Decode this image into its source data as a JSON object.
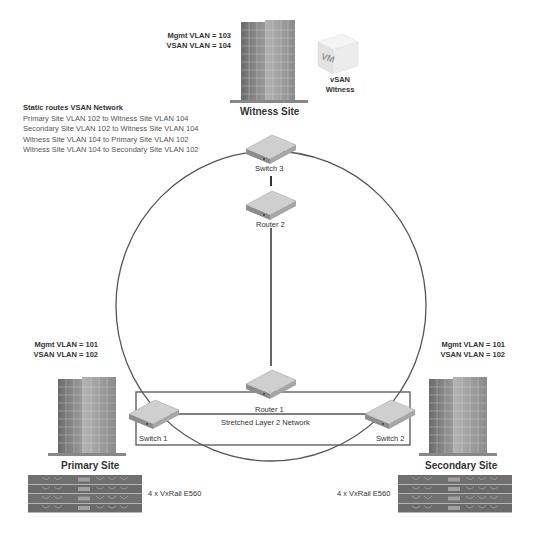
{
  "witness": {
    "mgmt_vlan": "Mgmt VLAN = 103",
    "vsan_vlan": "VSAN VLAN = 104",
    "vm_badge": "VM",
    "vm_label_line1": "vSAN",
    "vm_label_line2": "Witness",
    "site_title": "Witness Site"
  },
  "static_routes": {
    "title": "Static routes VSAN Network",
    "routes": [
      "Primary Site VLAN 102 to Witness Site VLAN 104",
      "Secondary Site VLAN 102 to Witness Site VLAN 104",
      "Witness Site VLAN 104 to Primary Site VLAN 102",
      "Witness Site VLAN 104 to Secondary Site VLAN 102"
    ]
  },
  "devices": {
    "switch3": "Switch 3",
    "router2": "Router 2",
    "router1": "Router 1",
    "switch1": "Switch 1",
    "switch2": "Switch 2"
  },
  "stretched_network": "Stretched Layer 2 Network",
  "primary": {
    "mgmt_vlan": "Mgmt VLAN = 101",
    "vsan_vlan": "VSAN VLAN = 102",
    "site_title": "Primary Site",
    "nodes_label": "4 x VxRail E560"
  },
  "secondary": {
    "mgmt_vlan": "Mgmt VLAN = 101",
    "vsan_vlan": "VSAN VLAN = 102",
    "site_title": "Secondary Site",
    "nodes_label": "4 x VxRail E560"
  },
  "colors": {
    "line": "#555555",
    "device_top": "#d8d8d8",
    "device_side": "#9a9a9a",
    "building_dark": "#7a7a7a",
    "building_light": "#cfcfcf",
    "server": "#6e6e6e"
  }
}
